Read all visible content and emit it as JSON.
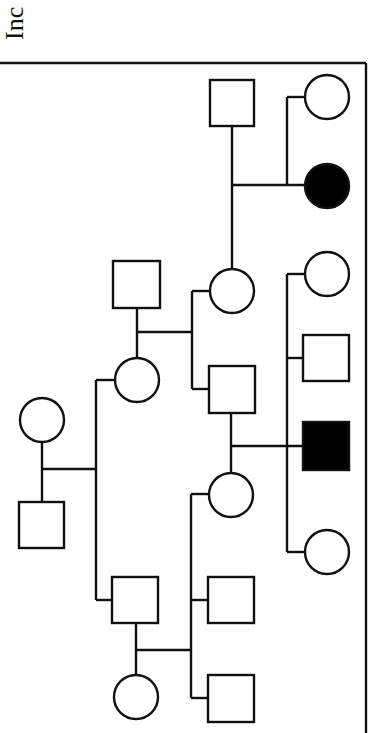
{
  "caption": {
    "text": "Inc"
  },
  "colors": {
    "line": "#111111",
    "affected": "#000000",
    "unaffected": "#ffffff"
  },
  "pedigree": {
    "orientation": "rotated-90",
    "individuals": [
      {
        "id": "I-1",
        "sex": "female",
        "affected": false
      },
      {
        "id": "I-2",
        "sex": "male",
        "affected": false
      },
      {
        "id": "II-1",
        "sex": "female",
        "affected": false
      },
      {
        "id": "II-2",
        "sex": "male",
        "affected": false
      },
      {
        "id": "II-3",
        "sex": "male",
        "affected": false
      },
      {
        "id": "III-1",
        "sex": "female",
        "affected": false
      },
      {
        "id": "III-2",
        "sex": "male",
        "affected": false
      },
      {
        "id": "III-3",
        "sex": "female",
        "affected": false
      },
      {
        "id": "III-4",
        "sex": "male",
        "affected": false
      },
      {
        "id": "III-5",
        "sex": "male",
        "affected": false
      },
      {
        "id": "III-6",
        "sex": "female",
        "affected": false
      },
      {
        "id": "IV-1",
        "sex": "male",
        "affected": false
      },
      {
        "id": "IV-2",
        "sex": "female",
        "affected": false
      },
      {
        "id": "IV-3",
        "sex": "female",
        "affected": false
      },
      {
        "id": "IV-4",
        "sex": "female",
        "affected": true
      },
      {
        "id": "IV-5",
        "sex": "male",
        "affected": false
      },
      {
        "id": "IV-6",
        "sex": "male",
        "affected": true
      },
      {
        "id": "IV-7",
        "sex": "female",
        "affected": false
      }
    ]
  }
}
